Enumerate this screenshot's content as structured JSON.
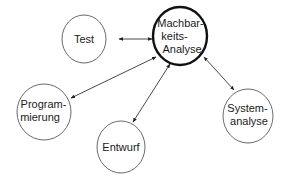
{
  "diagram": {
    "type": "hub-and-spoke",
    "center": {
      "id": "machbarkeitsanalyse",
      "lines": [
        "Machbar-",
        "keits-",
        "Analyse"
      ]
    },
    "nodes": [
      {
        "id": "test",
        "lines": [
          "Test"
        ]
      },
      {
        "id": "programmierung",
        "lines": [
          "Program-",
          "mierung"
        ]
      },
      {
        "id": "entwurf",
        "lines": [
          "Entwurf"
        ]
      },
      {
        "id": "systemanalyse",
        "lines": [
          "System-",
          "analyse"
        ]
      }
    ],
    "edges": [
      {
        "from": "test",
        "to": "machbarkeitsanalyse",
        "direction": "both"
      },
      {
        "from": "programmierung",
        "to": "machbarkeitsanalyse",
        "direction": "both"
      },
      {
        "from": "entwurf",
        "to": "machbarkeitsanalyse",
        "direction": "both"
      },
      {
        "from": "systemanalyse",
        "to": "machbarkeitsanalyse",
        "direction": "both"
      }
    ]
  }
}
